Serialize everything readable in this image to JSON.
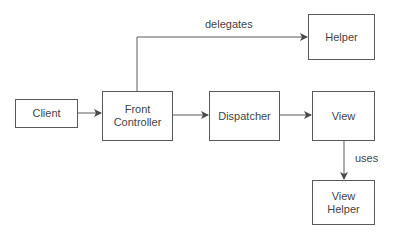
{
  "diagram": {
    "type": "flow",
    "nodes": {
      "client": {
        "label": "Client"
      },
      "front_controller": {
        "label": "Front Controller",
        "line1": "Front",
        "line2": "Controller"
      },
      "dispatcher": {
        "label": "Dispatcher"
      },
      "view": {
        "label": "View"
      },
      "helper": {
        "label": "Helper"
      },
      "view_helper": {
        "label": "View Helper",
        "line1": "View",
        "line2": "Helper"
      }
    },
    "edges": [
      {
        "from": "Client",
        "to": "Front Controller",
        "label": ""
      },
      {
        "from": "Front Controller",
        "to": "Helper",
        "label": "delegates"
      },
      {
        "from": "Front Controller",
        "to": "Dispatcher",
        "label": ""
      },
      {
        "from": "Dispatcher",
        "to": "View",
        "label": ""
      },
      {
        "from": "View",
        "to": "View Helper",
        "label": "uses"
      }
    ],
    "edge_labels": {
      "delegates": "delegates",
      "uses": "uses"
    },
    "colors": {
      "stroke": "#5a5a5a",
      "text": "#444444",
      "background": "#ffffff"
    }
  }
}
